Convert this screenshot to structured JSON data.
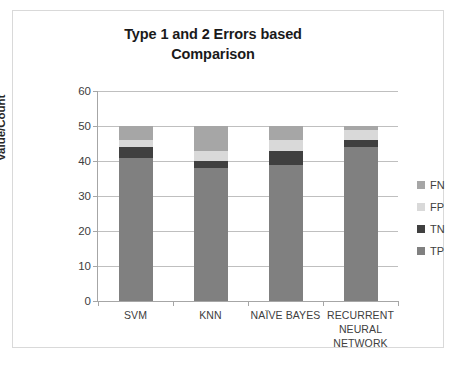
{
  "chart_data": {
    "type": "bar",
    "subtype": "stacked-column",
    "title": "Type 1 and 2 Errors based Comparison",
    "title_lines": [
      "Type 1 and 2 Errors based",
      "Comparison"
    ],
    "xlabel": "",
    "ylabel": "Value/Count",
    "ylim": [
      0,
      60
    ],
    "ytick_step": 10,
    "yticks": [
      0,
      10,
      20,
      30,
      40,
      50,
      60
    ],
    "ytick_labels": [
      "0",
      "10",
      "20",
      "30",
      "40",
      "50",
      "60"
    ],
    "grid": true,
    "grid_axis": "y",
    "legend_position": "right",
    "categories": [
      "SVM",
      "KNN",
      "NAÏVE BAYES",
      "RECURRENT NEURAL NETWORK"
    ],
    "category_lines": [
      [
        "SVM"
      ],
      [
        "KNN"
      ],
      [
        "NAÏVE BAYES"
      ],
      [
        "RECURRENT",
        "NEURAL",
        "NETWORK"
      ]
    ],
    "stack_order_bottom_to_top": [
      "TP",
      "TN",
      "FP",
      "FN"
    ],
    "series": [
      {
        "name": "TP",
        "color": "#808080",
        "values": [
          41,
          38,
          39,
          44
        ]
      },
      {
        "name": "TN",
        "color": "#404040",
        "values": [
          3,
          2,
          4,
          2
        ]
      },
      {
        "name": "FP",
        "color": "#d9d9d9",
        "values": [
          2,
          3,
          3,
          3
        ]
      },
      {
        "name": "FN",
        "color": "#a6a6a6",
        "values": [
          4,
          7,
          4,
          1
        ]
      }
    ],
    "cumulative_tops": [
      [
        41,
        44,
        46,
        50
      ],
      [
        38,
        40,
        43,
        50
      ],
      [
        39,
        43,
        46,
        50
      ],
      [
        44,
        46,
        49,
        50
      ]
    ],
    "totals": [
      50,
      50,
      50,
      50
    ]
  },
  "legend": {
    "items": [
      {
        "label": "FN",
        "color": "#a6a6a6"
      },
      {
        "label": "FP",
        "color": "#d9d9d9"
      },
      {
        "label": "TN",
        "color": "#404040"
      },
      {
        "label": "TP",
        "color": "#808080"
      }
    ]
  },
  "colors": {
    "frame_border": "#d9d9d9",
    "gridline": "#bfbfbf",
    "axis": "#a6a6a6",
    "text": "#404040",
    "title_text": "#1a1a1a",
    "plot_background": "#ffffff"
  }
}
